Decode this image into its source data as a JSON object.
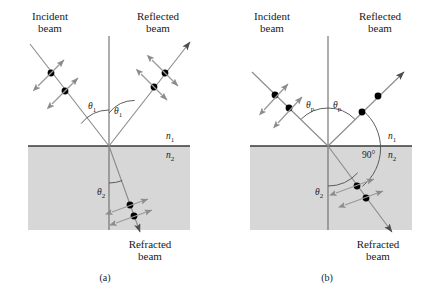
{
  "figure": {
    "title_caption_a": "(a)",
    "title_caption_b": "(b)",
    "background_color": "#ffffff",
    "medium_shade_color": "#d6d6d6",
    "line_color": "#4d4d4d",
    "dot_color": "#000000",
    "arrow_color": "#8c8c8c"
  },
  "panel_a": {
    "caption": "(a)",
    "incident_label_line1": "Incident",
    "incident_label_line2": "beam",
    "reflected_label_line1": "Reflected",
    "reflected_label_line2": "beam",
    "refracted_label_line1": "Refracted",
    "refracted_label_line2": "beam",
    "angle_incident": "θ",
    "angle_incident_sub": "1",
    "angle_reflected": "θ",
    "angle_reflected_sub": "1",
    "angle_refracted": "θ",
    "angle_refracted_sub": "2",
    "index_upper": "n",
    "index_upper_sub": "1",
    "index_lower": "n",
    "index_lower_sub": "2",
    "incident_polarization": "unpolarized",
    "reflected_polarization": "unpolarized",
    "refracted_polarization": "unpolarized"
  },
  "panel_b": {
    "caption": "(b)",
    "incident_label_line1": "Incident",
    "incident_label_line2": "beam",
    "reflected_label_line1": "Reflected",
    "reflected_label_line2": "beam",
    "refracted_label_line1": "Refracted",
    "refracted_label_line2": "beam",
    "angle_incident": "θ",
    "angle_incident_sub": "p",
    "angle_reflected": "θ",
    "angle_reflected_sub": "p",
    "angle_refracted": "θ",
    "angle_refracted_sub": "2",
    "angle_between": "90°",
    "index_upper": "n",
    "index_upper_sub": "1",
    "index_lower": "n",
    "index_lower_sub": "2",
    "incident_polarization": "unpolarized",
    "reflected_polarization": "fully polarized perpendicular",
    "refracted_polarization": "partially polarized"
  }
}
